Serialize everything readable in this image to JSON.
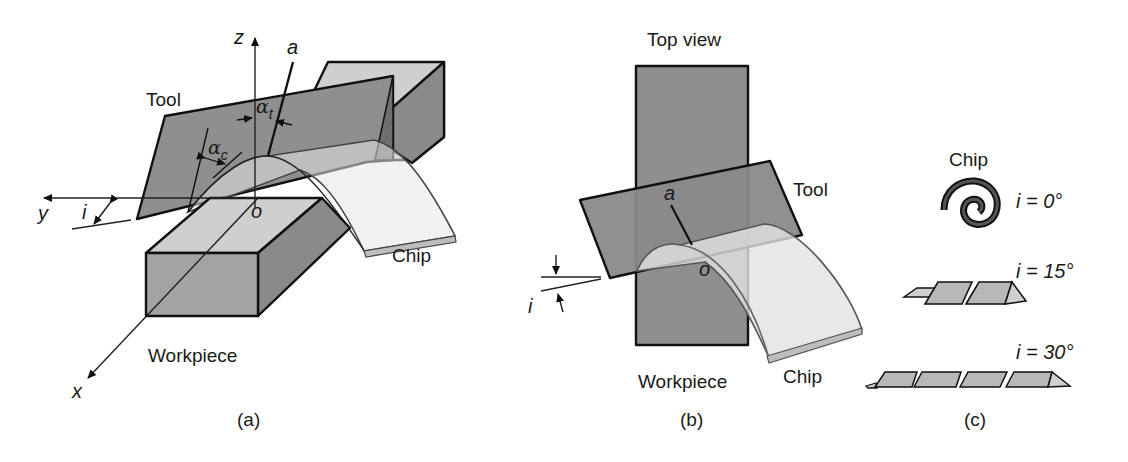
{
  "figure": {
    "panels": [
      {
        "id": "a",
        "caption": "(a)",
        "labels": {
          "tool": "Tool",
          "workpiece": "Workpiece",
          "chip": "Chip",
          "axis_x": "x",
          "axis_y": "y",
          "axis_z": "z",
          "origin": "o",
          "line_a": "a",
          "inclination": "i",
          "alpha": "α",
          "alpha_t_sub": "t",
          "alpha_c_sub": "c"
        }
      },
      {
        "id": "b",
        "caption": "(b)",
        "labels": {
          "title": "Top view",
          "tool": "Tool",
          "workpiece": "Workpiece",
          "chip": "Chip",
          "origin": "o",
          "line_a": "a",
          "inclination": "i"
        }
      },
      {
        "id": "c",
        "caption": "(c)",
        "labels": {
          "title": "Chip",
          "cases": [
            {
              "label": "i = 0°",
              "shape": "spiral-chip"
            },
            {
              "label": "i = 15°",
              "shape": "helical-chip-short"
            },
            {
              "label": "i = 30°",
              "shape": "helical-chip-long"
            }
          ]
        }
      }
    ],
    "colors": {
      "tool_face": "#8f8f8f",
      "workpiece_front": "#a3a3a3",
      "workpiece_top": "#cfcfcf",
      "workpiece_side": "#8a8a8a",
      "chip_face": "#e0e0e0",
      "outline": "#111111"
    }
  }
}
